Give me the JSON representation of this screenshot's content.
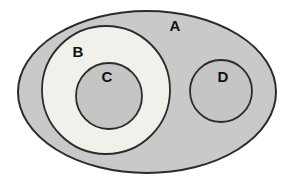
{
  "diagram": {
    "type": "euler-set-diagram",
    "labels": {
      "set_a": "A",
      "set_b": "B",
      "set_c": "C",
      "set_d": "D"
    },
    "colors": {
      "background": "#ffffff",
      "set_a_fill": "#c9c9c9",
      "set_b_fill": "#f1f0ea",
      "set_c_fill": "#c5c5c5",
      "set_d_fill": "#c5c5c5",
      "stroke": "#2b2b2b",
      "label_color": "#111111"
    }
  }
}
